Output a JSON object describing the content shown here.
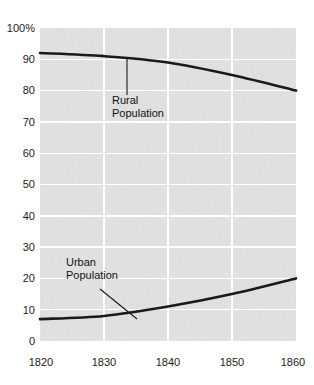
{
  "chart_data": {
    "type": "line",
    "title": "",
    "subtitle": "",
    "xlabel": "",
    "ylabel": "",
    "xlim": [
      1820,
      1860
    ],
    "ylim": [
      0,
      100
    ],
    "grid": true,
    "legend_position": "inline-annotations",
    "x": [
      1820,
      1830,
      1840,
      1850,
      1860
    ],
    "xticklabels": [
      "1820",
      "1830",
      "1840",
      "1850",
      "1860"
    ],
    "yticks": [
      0,
      10,
      20,
      30,
      40,
      50,
      60,
      70,
      80,
      90,
      100
    ],
    "yticklabels": [
      "0",
      "10",
      "20",
      "30",
      "40",
      "50",
      "60",
      "70",
      "80",
      "90",
      "100%"
    ],
    "series": [
      {
        "name": "Rural Population",
        "values": [
          92,
          91,
          89,
          85,
          80
        ]
      },
      {
        "name": "Urban Population",
        "values": [
          7,
          8,
          11,
          15,
          20
        ]
      }
    ],
    "annotations": [
      {
        "text_line1": "Rural",
        "text_line2": "Population"
      },
      {
        "text_line1": "Urban",
        "text_line2": "Population"
      }
    ],
    "colors": {
      "line": "#1a1a1a",
      "plot_background": "#e3e3e3",
      "gridline": "#ffffff",
      "page_background": "#ffffff",
      "text": "#1b1b1b"
    }
  },
  "axes": {
    "y_labels": {
      "t100": "100%",
      "t90": "90",
      "t80": "80",
      "t70": "70",
      "t60": "60",
      "t50": "50",
      "t40": "40",
      "t30": "30",
      "t20": "20",
      "t10": "10",
      "t0": "0"
    },
    "x_labels": {
      "x1820": "1820",
      "x1830": "1830",
      "x1840": "1840",
      "x1850": "1850",
      "x1860": "1860"
    }
  },
  "annotations": {
    "rural": {
      "line1": "Rural",
      "line2": "Population"
    },
    "urban": {
      "line1": "Urban",
      "line2": "Population"
    }
  }
}
